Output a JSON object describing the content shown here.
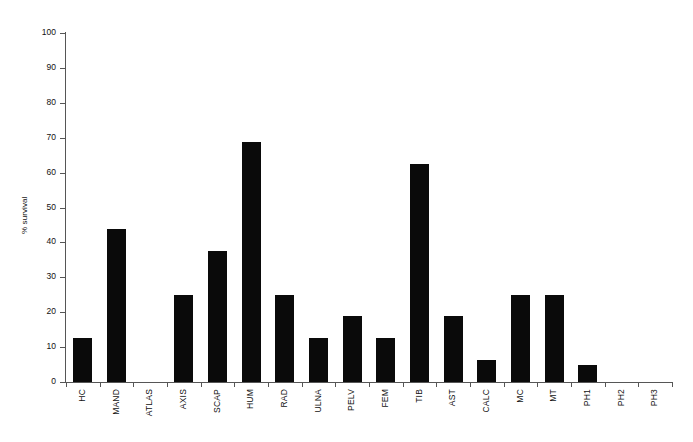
{
  "chart_data": {
    "type": "bar",
    "title": "",
    "subtitle": "",
    "xlabel": "",
    "ylabel": "% survival",
    "ylim": [
      0,
      100
    ],
    "yticks": [
      0,
      10,
      20,
      30,
      40,
      50,
      60,
      70,
      80,
      90,
      100
    ],
    "grid": false,
    "legend": null,
    "bar_color": "#0a0a0a",
    "axis_color": "#565656",
    "categories": [
      "HC",
      "MAND",
      "ATLAS",
      "AXIS",
      "SCAP",
      "HUM",
      "RAD",
      "ULNA",
      "PELV",
      "FEM",
      "TIB",
      "AST",
      "CALC",
      "MC",
      "MT",
      "PH1",
      "PH2",
      "PH3"
    ],
    "values": [
      12.5,
      43.8,
      0,
      25,
      37.5,
      68.8,
      25,
      12.5,
      18.8,
      12.5,
      62.5,
      18.8,
      6.3,
      25,
      25,
      5,
      0,
      0
    ]
  }
}
